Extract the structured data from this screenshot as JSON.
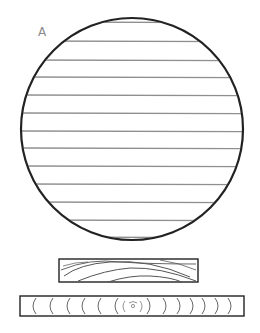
{
  "figure": {
    "label": "A",
    "colors": {
      "outline": "#222222",
      "hatch": "#8f8f8f",
      "grain": "#555555",
      "label": "#8a8a8a",
      "background": "#ffffff"
    },
    "log_section": {
      "shape": "circle",
      "center": [
        132,
        129
      ],
      "radius": 111,
      "hatch_lines_y": [
        22,
        41,
        60,
        77,
        95,
        113,
        131,
        148,
        166,
        184,
        202,
        220,
        237
      ]
    },
    "flat_sawn_board": {
      "shape": "rectangle",
      "x": 59,
      "y": 259,
      "width": 139,
      "height": 23,
      "grain": "arched curves"
    },
    "end_grain_strip": {
      "shape": "rectangle",
      "x": 20,
      "y": 296,
      "width": 224,
      "height": 20,
      "left_arcs_x": [
        33,
        50,
        67,
        82,
        98,
        115
      ],
      "right_arcs_x": [
        150,
        166,
        180,
        193,
        205,
        218,
        231
      ],
      "pith_x": 133
    }
  }
}
